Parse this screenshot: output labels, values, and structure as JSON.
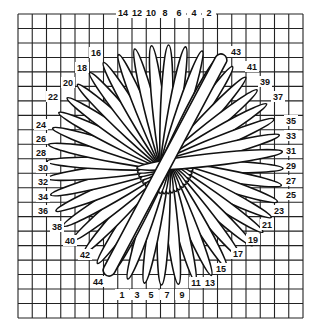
{
  "diagram": {
    "title": "",
    "grid": {
      "x0": 18,
      "y0": 14,
      "x1": 303,
      "y1": 318,
      "cols": 20,
      "rows": 21,
      "line_color": "#222222"
    },
    "center": {
      "x": 165,
      "y": 165
    },
    "colors": {
      "petal_fill": "#ffffff",
      "petal_stroke": "#111111",
      "label": "#111111",
      "background": "#ffffff"
    },
    "labels": [
      {
        "t": "14",
        "x": 123,
        "y": 16
      },
      {
        "t": "12",
        "x": 137,
        "y": 16
      },
      {
        "t": "10",
        "x": 151,
        "y": 16
      },
      {
        "t": "8",
        "x": 165,
        "y": 16
      },
      {
        "t": "6",
        "x": 179,
        "y": 16
      },
      {
        "t": "4",
        "x": 194,
        "y": 16
      },
      {
        "t": "2",
        "x": 209,
        "y": 16
      },
      {
        "t": "16",
        "x": 96,
        "y": 56
      },
      {
        "t": "18",
        "x": 82,
        "y": 71
      },
      {
        "t": "20",
        "x": 68,
        "y": 86
      },
      {
        "t": "22",
        "x": 53,
        "y": 100
      },
      {
        "t": "24",
        "x": 41,
        "y": 128
      },
      {
        "t": "26",
        "x": 41,
        "y": 142
      },
      {
        "t": "28",
        "x": 41,
        "y": 156
      },
      {
        "t": "30",
        "x": 43,
        "y": 171
      },
      {
        "t": "32",
        "x": 43,
        "y": 185
      },
      {
        "t": "34",
        "x": 43,
        "y": 200
      },
      {
        "t": "36",
        "x": 43,
        "y": 214
      },
      {
        "t": "38",
        "x": 57,
        "y": 230
      },
      {
        "t": "40",
        "x": 70,
        "y": 244
      },
      {
        "t": "42",
        "x": 85,
        "y": 258
      },
      {
        "t": "44",
        "x": 98,
        "y": 285
      },
      {
        "t": "1",
        "x": 122,
        "y": 298
      },
      {
        "t": "3",
        "x": 137,
        "y": 298
      },
      {
        "t": "5",
        "x": 151,
        "y": 298
      },
      {
        "t": "7",
        "x": 167,
        "y": 298
      },
      {
        "t": "9",
        "x": 182,
        "y": 298
      },
      {
        "t": "11",
        "x": 196,
        "y": 286
      },
      {
        "t": "13",
        "x": 210,
        "y": 286
      },
      {
        "t": "15",
        "x": 221,
        "y": 272
      },
      {
        "t": "17",
        "x": 238,
        "y": 257
      },
      {
        "t": "19",
        "x": 253,
        "y": 243
      },
      {
        "t": "21",
        "x": 267,
        "y": 228
      },
      {
        "t": "23",
        "x": 279,
        "y": 214
      },
      {
        "t": "25",
        "x": 291,
        "y": 198
      },
      {
        "t": "27",
        "x": 291,
        "y": 184
      },
      {
        "t": "29",
        "x": 291,
        "y": 169
      },
      {
        "t": "31",
        "x": 291,
        "y": 154
      },
      {
        "t": "33",
        "x": 291,
        "y": 139
      },
      {
        "t": "35",
        "x": 291,
        "y": 124
      },
      {
        "t": "37",
        "x": 278,
        "y": 100
      },
      {
        "t": "39",
        "x": 265,
        "y": 85
      },
      {
        "t": "41",
        "x": 252,
        "y": 70
      },
      {
        "t": "43",
        "x": 236,
        "y": 55
      }
    ]
  }
}
